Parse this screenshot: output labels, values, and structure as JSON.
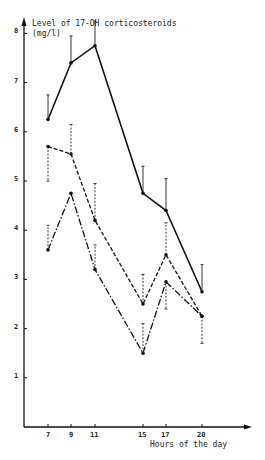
{
  "chart_data": {
    "type": "line",
    "title": "",
    "ylabel": "Level of 17-OH corticosteroids",
    "ylabel_unit": "(mg/l)",
    "xlabel": "Hours of the day",
    "x": [
      7,
      9,
      11,
      15,
      17,
      20
    ],
    "ylim": [
      0,
      8
    ],
    "yticks": [
      1,
      2,
      3,
      4,
      5,
      6,
      7,
      8
    ],
    "grid": false,
    "legend": null,
    "series": [
      {
        "name": "solid",
        "style": "solid",
        "values": [
          6.25,
          7.4,
          7.75,
          4.75,
          4.4,
          2.75
        ],
        "error_upper": [
          6.75,
          7.95,
          8.25,
          5.3,
          5.05,
          3.3
        ],
        "error_lower": [
          null,
          null,
          null,
          null,
          null,
          null
        ]
      },
      {
        "name": "dashed",
        "style": "dashed",
        "values": [
          5.7,
          5.55,
          4.2,
          2.5,
          3.5,
          2.25
        ],
        "error_upper": [
          null,
          6.15,
          4.95,
          3.1,
          4.15,
          null
        ],
        "error_lower": [
          5.0,
          null,
          null,
          null,
          null,
          1.7
        ]
      },
      {
        "name": "dash-dot",
        "style": "dashdot",
        "values": [
          3.6,
          4.75,
          3.2,
          1.5,
          2.95,
          2.25
        ],
        "error_upper": [
          4.1,
          null,
          3.7,
          2.1,
          null,
          null
        ],
        "error_lower": [
          null,
          null,
          null,
          null,
          2.4,
          null
        ]
      }
    ]
  }
}
